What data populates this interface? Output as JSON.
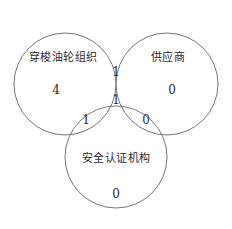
{
  "diagram": {
    "type": "venn",
    "background_color": "#ffffff",
    "stroke_color": "#777777",
    "text_color": "#2b2b2b",
    "sets": [
      {
        "id": "shuttle-tanker-org",
        "label": "穿梭油轮组织",
        "label_x": 63,
        "label_y": 57,
        "cx": 65,
        "cy": 84,
        "r": 51
      },
      {
        "id": "supplier",
        "label": "供应商",
        "label_x": 168,
        "label_y": 57,
        "cx": 167,
        "cy": 84,
        "r": 51
      },
      {
        "id": "safety-certification-agency",
        "label": "安全认证机构",
        "label_x": 116,
        "label_y": 158,
        "cx": 116,
        "cy": 157,
        "r": 51
      }
    ],
    "regions": [
      {
        "id": "only-shuttle-tanker-org",
        "value": "4",
        "x": 56,
        "y": 90
      },
      {
        "id": "only-supplier",
        "value": "0",
        "x": 172,
        "y": 90
      },
      {
        "id": "only-safety-certification-agency",
        "value": "0",
        "x": 116,
        "y": 194
      },
      {
        "id": "shuttle-tanker-org-and-supplier",
        "value": "1",
        "x": 116,
        "y": 72
      },
      {
        "id": "shuttle-tanker-org-and-safety-agency",
        "value": "1",
        "x": 86,
        "y": 120
      },
      {
        "id": "supplier-and-safety-agency",
        "value": "0",
        "x": 146,
        "y": 120
      },
      {
        "id": "all-three-sets",
        "value": "1",
        "x": 116,
        "y": 100
      }
    ]
  }
}
